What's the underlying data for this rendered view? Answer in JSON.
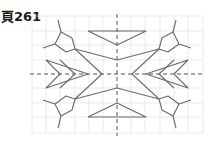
{
  "page": {
    "title": "頁261"
  },
  "figure": {
    "grid": {
      "x0": 32,
      "y0": 16,
      "x1": 203,
      "y1": 133,
      "cell": 14.25,
      "color": "#e2e2e2"
    },
    "axes": {
      "cx": 117,
      "cy": 74,
      "color": "#555555"
    },
    "stroke_color": "#6a6a6a"
  }
}
